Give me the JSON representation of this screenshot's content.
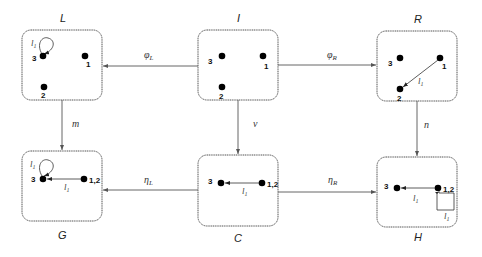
{
  "graphs": {
    "L": {
      "label": "L",
      "nodes": [
        "3",
        "1",
        "2"
      ],
      "loop_label": "l1"
    },
    "I": {
      "label": "I",
      "nodes": [
        "3",
        "1",
        "2"
      ]
    },
    "R": {
      "label": "R",
      "nodes": [
        "3",
        "1",
        "2"
      ],
      "edge_label": "l1"
    },
    "G": {
      "label": "G",
      "nodes": [
        "3",
        "1,2"
      ],
      "loop_label": "l1",
      "edge_label": "l1"
    },
    "C": {
      "label": "C",
      "nodes": [
        "3",
        "1,2"
      ],
      "edge_label": "l1"
    },
    "H": {
      "label": "H",
      "nodes": [
        "3",
        "1,2"
      ],
      "edge_label": "l1",
      "loop_label": "l1"
    }
  },
  "morphisms": {
    "phi_L": "φL",
    "phi_R": "φR",
    "m": "m",
    "nu": "ν",
    "n": "n",
    "eta_L": "ηL",
    "eta_R": "ηR"
  },
  "text": {
    "l": "l",
    "sub1": "1",
    "phi": "φ",
    "eta": "η",
    "subL": "L",
    "subR": "R"
  }
}
